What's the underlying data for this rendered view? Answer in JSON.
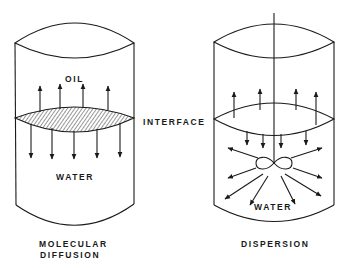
{
  "diagram": {
    "type": "comparison of two mixing mechanisms in oil/water vessels",
    "colors": {
      "line": "#1a1a1a",
      "background": "#ffffff"
    },
    "left_vessel": {
      "title_line1": "MOLECULAR",
      "title_line2": "DIFFUSION",
      "upper_phase_label": "OIL",
      "lower_phase_label": "WATER",
      "interface_style": "hatched",
      "up_arrow_count": 4,
      "down_arrow_count": 5
    },
    "center_label": "INTERFACE",
    "right_vessel": {
      "title": "DISPERSION",
      "lower_phase_label": "WATER",
      "has_impeller": true,
      "up_arrow_count": 4,
      "down_arrow_count": 4,
      "radial_arrow_count": 8
    }
  }
}
